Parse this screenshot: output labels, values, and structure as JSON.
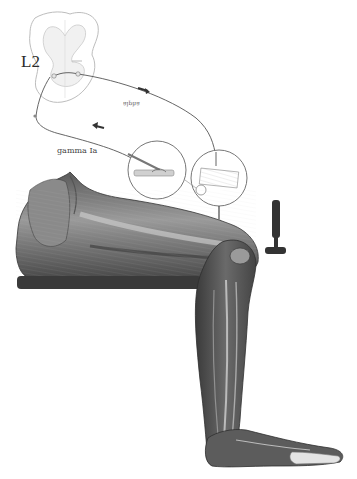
{
  "diagram": {
    "labels": {
      "spinal_level": "L2",
      "afferent": "gamma Ia",
      "efferent": "alpha"
    },
    "components": [
      {
        "id": "spinal-cord-section",
        "description": "Cross-section of spinal cord at L2 with dorsal and ventral roots"
      },
      {
        "id": "afferent-fiber",
        "description": "Sensory (Ia) fiber from muscle spindle to spinal cord"
      },
      {
        "id": "efferent-fiber",
        "description": "Alpha motor fiber from spinal cord to quadriceps"
      },
      {
        "id": "direction-arrow-afferent",
        "description": "Arrow toward spinal cord on afferent path"
      },
      {
        "id": "direction-arrow-efferent",
        "description": "Arrow toward muscle on efferent path"
      },
      {
        "id": "inset-spindle",
        "description": "Circular inset: muscle spindle with annulospiral ending"
      },
      {
        "id": "inset-motor-endplate",
        "description": "Circular inset: motor end plates on extrafusal fibers"
      },
      {
        "id": "reflex-hammer",
        "description": "Reflex hammer striking patellar tendon"
      },
      {
        "id": "thigh-quadriceps",
        "description": "Anatomical drawing of thigh musculature resting on table"
      },
      {
        "id": "table-edge",
        "description": "Dark horizontal bar supporting the thigh"
      },
      {
        "id": "lower-leg",
        "description": "Lower leg muscles hanging over table edge"
      },
      {
        "id": "foot",
        "description": "Foot with toes"
      }
    ],
    "colors": {
      "ink": "#2a2a2a",
      "muscle_dark": "#3c3c3c",
      "muscle_mid": "#6e6e6e",
      "muscle_light": "#b5b5b5",
      "table": "#3a3a3a",
      "line": "#555555",
      "background": "#ffffff"
    }
  }
}
